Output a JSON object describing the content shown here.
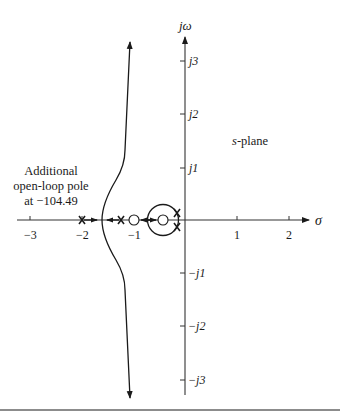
{
  "diagram": {
    "type": "root-locus",
    "plane_label": "s-plane",
    "plane_label_italic_part": "s",
    "plane_label_rest": "-plane",
    "axes": {
      "real_label": "σ",
      "imag_label": "jω",
      "real_ticks": [
        {
          "value": -3,
          "label": "−3"
        },
        {
          "value": -2,
          "label": "−2"
        },
        {
          "value": -1,
          "label": "−1"
        },
        {
          "value": 1,
          "label": "1"
        },
        {
          "value": 2,
          "label": "2"
        }
      ],
      "imag_ticks": [
        {
          "value": 3,
          "label": "j3"
        },
        {
          "value": 2,
          "label": "j2"
        },
        {
          "value": 1,
          "label": "j1"
        },
        {
          "value": -1,
          "label": "−j1"
        },
        {
          "value": -2,
          "label": "−j2"
        },
        {
          "value": -3,
          "label": "−j3"
        }
      ]
    },
    "annotation": {
      "line1": "Additional",
      "line2": "open-loop pole",
      "line3": "at −104.49"
    },
    "open_loop_poles": [
      {
        "re": -2.0,
        "im": 0
      },
      {
        "re": -1.24,
        "im": 0
      },
      {
        "re": -0.15,
        "im": 0.13
      },
      {
        "re": -0.15,
        "im": -0.13
      }
    ],
    "open_loop_zeros": [
      {
        "re": -1.0,
        "im": 0
      },
      {
        "re": -0.42,
        "im": 0
      }
    ],
    "colors": {
      "ink": "#1a1a1a",
      "axis": "#333333",
      "rule": "#8c8c8c"
    }
  }
}
